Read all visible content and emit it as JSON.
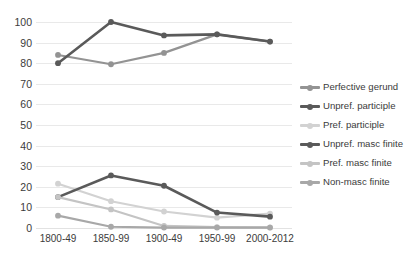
{
  "chart_data": {
    "type": "line",
    "title": "",
    "xlabel": "",
    "ylabel": "",
    "categories": [
      "1800-49",
      "1850-99",
      "1900-49",
      "1950-99",
      "2000-2012"
    ],
    "ylim": [
      0,
      100
    ],
    "ytick_step": 10,
    "yticks": [
      "100",
      "90",
      "80",
      "70",
      "60",
      "50",
      "40",
      "30",
      "20",
      "10",
      "0"
    ],
    "grid": true,
    "legend_position": "right",
    "series": [
      {
        "name": "Perfective gerund",
        "color": "#939393",
        "width": 2.2,
        "values": [
          84,
          79.5,
          85,
          94,
          90.5
        ]
      },
      {
        "name": "Unpref. participle",
        "color": "#5a5a5a",
        "width": 2.6,
        "values": [
          80,
          100,
          93.5,
          94,
          90.5
        ]
      },
      {
        "name": "Pref. participle",
        "color": "#d2d2d2",
        "width": 2.2,
        "values": [
          21.5,
          13,
          8,
          5,
          7
        ]
      },
      {
        "name": "Unpref. masc finite",
        "color": "#5a5a5a",
        "width": 2.6,
        "values": [
          15,
          25.5,
          20.5,
          7.5,
          5.5
        ]
      },
      {
        "name": "Pref. masc finite",
        "color": "#c4c4c4",
        "width": 2.2,
        "values": [
          15,
          9,
          1,
          0.4,
          0.3
        ]
      },
      {
        "name": "Non-masc finite",
        "color": "#a8a8a8",
        "width": 2.2,
        "values": [
          6,
          0.6,
          0.2,
          0.2,
          0.2
        ]
      }
    ]
  },
  "legend": {
    "items": [
      {
        "label": "Perfective gerund"
      },
      {
        "label": "Unpref. participle"
      },
      {
        "label": "Pref. participle"
      },
      {
        "label": "Unpref. masc finite"
      },
      {
        "label": "Pref. masc finite"
      },
      {
        "label": "Non-masc finite"
      }
    ]
  }
}
